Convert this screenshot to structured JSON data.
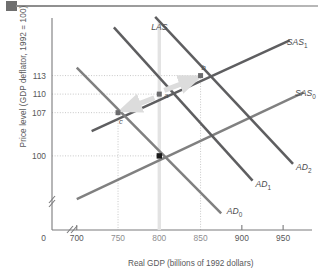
{
  "header": {
    "block_icon": "solid-block-marker",
    "rule_icon": "horizontal-rule"
  },
  "chart_data": {
    "type": "line",
    "title": "",
    "xlabel": "Real GDP (billions of 1992 dollars)",
    "ylabel": "Price level (GDP deflator, 1992 = 100)",
    "xlim": [
      670,
      985
    ],
    "ylim": [
      88,
      122
    ],
    "grid": "dotted-guides-to-labeled-points",
    "axis_breaks": {
      "x_break": "//",
      "y_break": "//",
      "origin_label": "0"
    },
    "xticks": [
      {
        "value": 700,
        "label": "700",
        "kind": "major"
      },
      {
        "value": 750,
        "label": "750",
        "kind": "minor"
      },
      {
        "value": 800,
        "label": "800",
        "kind": "minor"
      },
      {
        "value": 850,
        "label": "850",
        "kind": "minor"
      },
      {
        "value": 900,
        "label": "900",
        "kind": "major"
      },
      {
        "value": 950,
        "label": "950",
        "kind": "major"
      }
    ],
    "yticks": [
      {
        "value": 113,
        "label": "113"
      },
      {
        "value": 110,
        "label": "110"
      },
      {
        "value": 107,
        "label": "107"
      },
      {
        "value": 100,
        "label": "100"
      }
    ],
    "series": [
      {
        "name": "LAS",
        "label": "LAS",
        "kind": "vertical-line",
        "color": "#e3e3e3",
        "x": 800,
        "label_pos": {
          "x": 800,
          "y": 121
        }
      },
      {
        "name": "SAS0",
        "label": "SAS",
        "sub": "0",
        "kind": "upward-sloping",
        "color": "#808080",
        "points": [
          [
            700,
            93.0
          ],
          [
            975,
            110.3
          ]
        ],
        "label_pos": {
          "x": 962,
          "y": 109.5
        }
      },
      {
        "name": "SAS1",
        "label": "SAS",
        "sub": "1",
        "kind": "upward-sloping",
        "color": "#5e5e60",
        "points": [
          [
            718,
            104.0
          ],
          [
            958,
            118.7
          ]
        ],
        "label_pos": {
          "x": 952,
          "y": 117.8
        }
      },
      {
        "name": "AD0",
        "label": "AD",
        "sub": "0",
        "kind": "downward-sloping",
        "color": "#808080",
        "points": [
          [
            700,
            114.3
          ],
          [
            875,
            90.7
          ]
        ],
        "label_pos": {
          "x": 878,
          "y": 91.3
        }
      },
      {
        "name": "AD1",
        "label": "AD",
        "sub": "1",
        "kind": "downward-sloping",
        "color": "#5e5e60",
        "points": [
          [
            745,
            120.8
          ],
          [
            913,
            96.0
          ]
        ],
        "label_pos": {
          "x": 913,
          "y": 95.6
        }
      },
      {
        "name": "AD2",
        "label": "AD",
        "sub": "2",
        "kind": "downward-sloping",
        "color": "#5e5e60",
        "points": [
          [
            795,
            122.5
          ],
          [
            962,
            98.7
          ]
        ],
        "label_pos": {
          "x": 962,
          "y": 98.3
        }
      }
    ],
    "points": [
      {
        "id": "a",
        "label": "a",
        "x": 800,
        "y": 110,
        "marker": "grey-square",
        "color": "#6b6b6d",
        "label_dx": 5,
        "label_dy": 2
      },
      {
        "id": "b",
        "label": "b",
        "x": 850,
        "y": 113,
        "marker": "grey-square",
        "color": "#6b6b6d",
        "label_dx": 1,
        "label_dy": -8
      },
      {
        "id": "c",
        "label": "c",
        "x": 750,
        "y": 107,
        "marker": "grey-square",
        "color": "#6b6b6d",
        "label_dx": 1,
        "label_dy": 9
      },
      {
        "id": "origin-eq",
        "label": "",
        "x": 800,
        "y": 100,
        "marker": "black-square",
        "color": "#1a1a1a",
        "label_dx": 0,
        "label_dy": 0
      }
    ],
    "arrows": [
      {
        "name": "arrow-a-to-b",
        "from": [
          806,
          110.6
        ],
        "to": [
          845,
          112.6
        ],
        "color": "#dcdcdc"
      },
      {
        "name": "arrow-a-to-c",
        "from": [
          794,
          109.4
        ],
        "to": [
          757,
          107.5
        ],
        "color": "#dcdcdc"
      }
    ]
  }
}
